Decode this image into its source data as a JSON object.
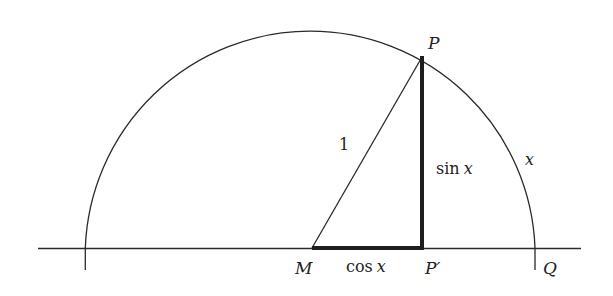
{
  "diagram": {
    "colors": {
      "stroke": "#2a2a2a",
      "background": "#ffffff",
      "text": "#222222"
    },
    "geometry": {
      "center_M": [
        310,
        248
      ],
      "radius": 225,
      "point_P": [
        422,
        57
      ],
      "point_P_prime": [
        422,
        248
      ],
      "point_Q": [
        535,
        248
      ],
      "axis_x_start": 38,
      "axis_x_end": 581
    },
    "labels": {
      "P": "P",
      "P_prime": "P′",
      "M": "M",
      "Q": "Q",
      "radius": "1",
      "sin": "sin",
      "sin_var": "x",
      "cos": "cos",
      "cos_var": "x",
      "arc": "x"
    }
  }
}
